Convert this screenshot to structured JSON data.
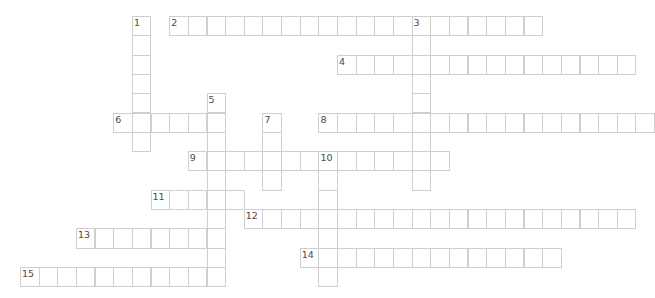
{
  "puzzle": {
    "type": "crossword",
    "grid": {
      "origin_x": 20,
      "origin_y": 16,
      "cell_w": 18.65,
      "cell_h": 19.3
    },
    "colors": {
      "border": "#cfcfcf",
      "cell_bg": "#ffffff",
      "number": "#4a4a4a"
    },
    "words": [
      {
        "number": "1",
        "direction": "down",
        "col": 6,
        "row": 0,
        "length": 7
      },
      {
        "number": "2",
        "direction": "across",
        "col": 8,
        "row": 0,
        "length": 20
      },
      {
        "number": "3",
        "direction": "down",
        "col": 21,
        "row": 0,
        "length": 9
      },
      {
        "number": "4",
        "direction": "across",
        "col": 17,
        "row": 2,
        "length": 16
      },
      {
        "number": "5",
        "direction": "down",
        "col": 10,
        "row": 4,
        "length": 10
      },
      {
        "number": "6",
        "direction": "across",
        "col": 5,
        "row": 5,
        "length": 6
      },
      {
        "number": "7",
        "direction": "down",
        "col": 13,
        "row": 5,
        "length": 4
      },
      {
        "number": "8",
        "direction": "across",
        "col": 16,
        "row": 5,
        "length": 18
      },
      {
        "number": "9",
        "direction": "across",
        "col": 9,
        "row": 7,
        "length": 14
      },
      {
        "number": "10",
        "direction": "down",
        "col": 16,
        "row": 7,
        "length": 7
      },
      {
        "number": "11",
        "direction": "across",
        "col": 7,
        "row": 9,
        "length": 5
      },
      {
        "number": "12",
        "direction": "across",
        "col": 12,
        "row": 10,
        "length": 21
      },
      {
        "number": "13",
        "direction": "across",
        "col": 3,
        "row": 11,
        "length": 8
      },
      {
        "number": "14",
        "direction": "across",
        "col": 15,
        "row": 12,
        "length": 14
      },
      {
        "number": "15",
        "direction": "across",
        "col": 0,
        "row": 13,
        "length": 11
      }
    ]
  }
}
